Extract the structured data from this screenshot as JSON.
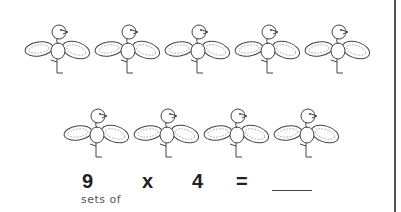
{
  "worksheet": {
    "rows": [
      {
        "count": 5,
        "item": "bird-with-peanut-wings"
      },
      {
        "count": 4,
        "item": "bird-with-peanut-wings"
      }
    ],
    "equation": {
      "groups": "9",
      "operator": "x",
      "operator_caption": "sets of",
      "per_group": "4",
      "equals": "=",
      "answer": ""
    }
  }
}
